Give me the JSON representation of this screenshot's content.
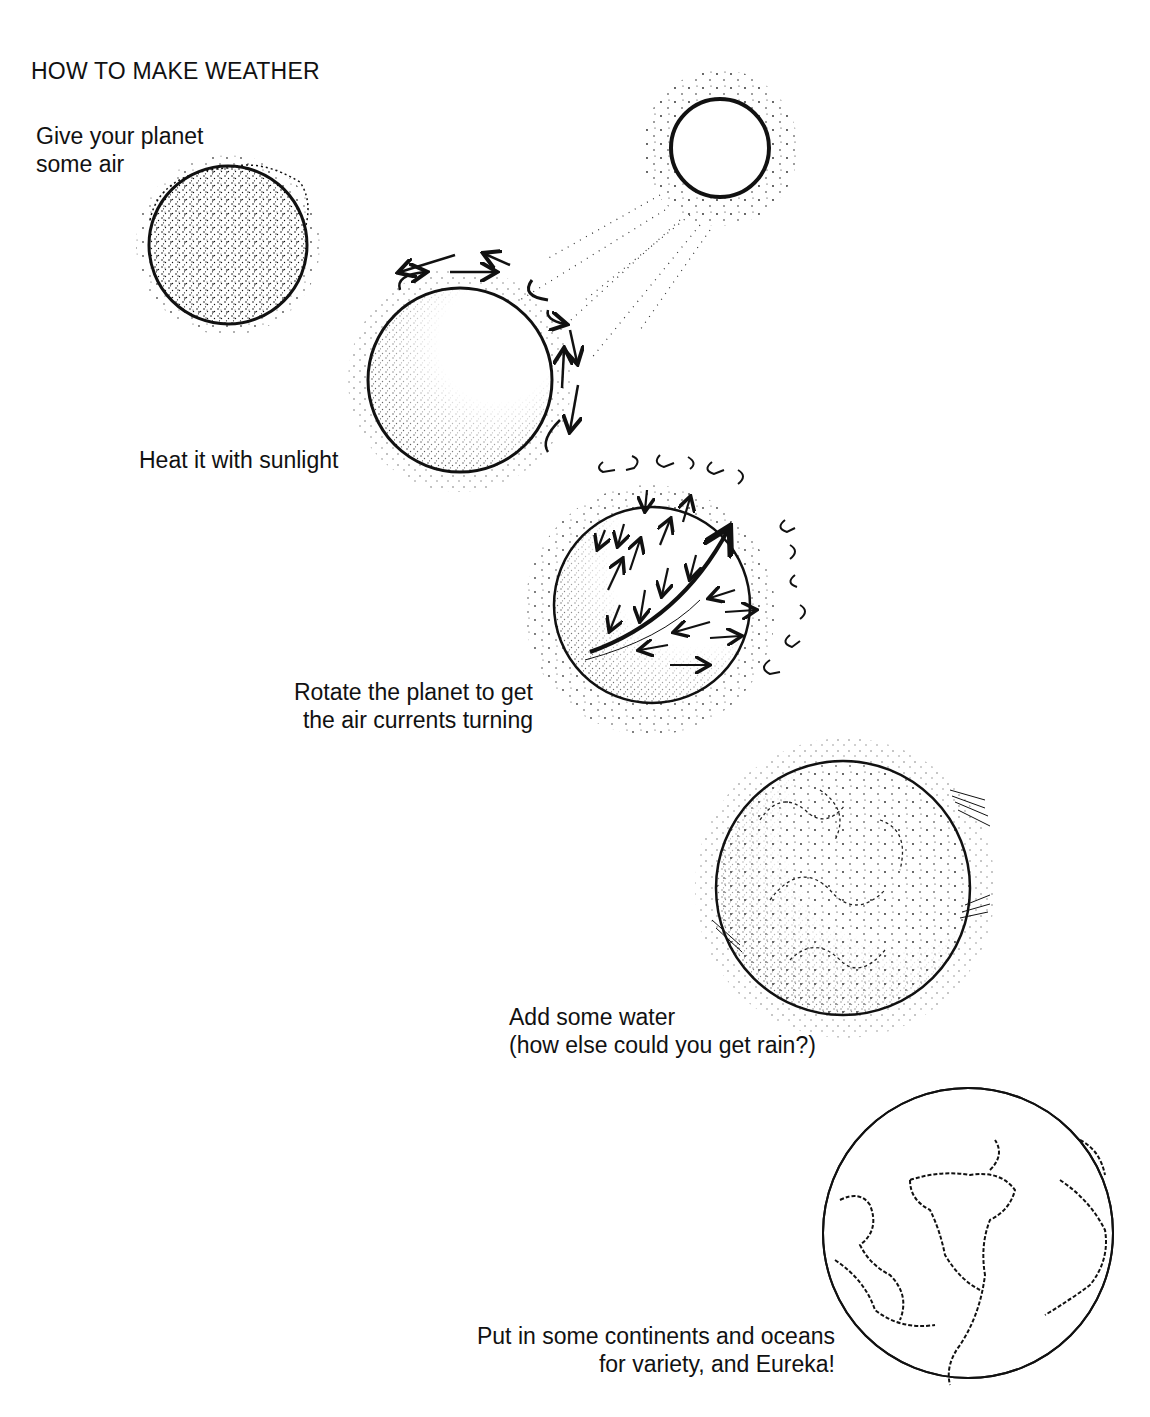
{
  "title": "HOW TO MAKE WEATHER",
  "steps": [
    {
      "id": "air",
      "caption_lines": [
        "Give your planet",
        "some air"
      ],
      "illustration": "planet-with-atmosphere"
    },
    {
      "id": "sun",
      "caption_lines": [
        "Heat it with sunlight"
      ],
      "illustration": "sun-heating-planet"
    },
    {
      "id": "rotate",
      "caption_lines": [
        "Rotate the planet to get",
        "the air currents turning"
      ],
      "illustration": "rotating-planet-air-currents"
    },
    {
      "id": "water",
      "caption_lines": [
        "Add some water",
        "(how else could you get rain?)"
      ],
      "illustration": "planet-with-clouds"
    },
    {
      "id": "continents",
      "caption_lines": [
        "Put in some continents and oceans",
        "for variety, and Eureka!"
      ],
      "illustration": "earth-with-continents"
    }
  ],
  "colors": {
    "ink": "#111111",
    "paper": "#ffffff"
  }
}
